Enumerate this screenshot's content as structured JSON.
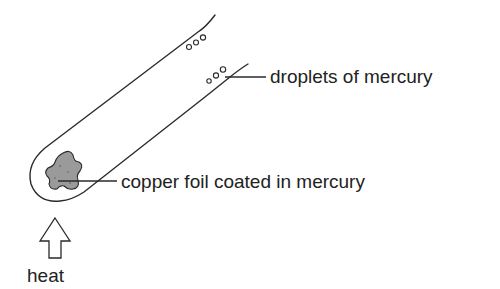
{
  "diagram": {
    "labels": {
      "droplets": "droplets of mercury",
      "copper": "copper foil coated in mercury",
      "heat": "heat"
    },
    "colors": {
      "stroke": "#2a2a2a",
      "foil_fill": "#9a9a9a",
      "background": "#ffffff"
    }
  }
}
